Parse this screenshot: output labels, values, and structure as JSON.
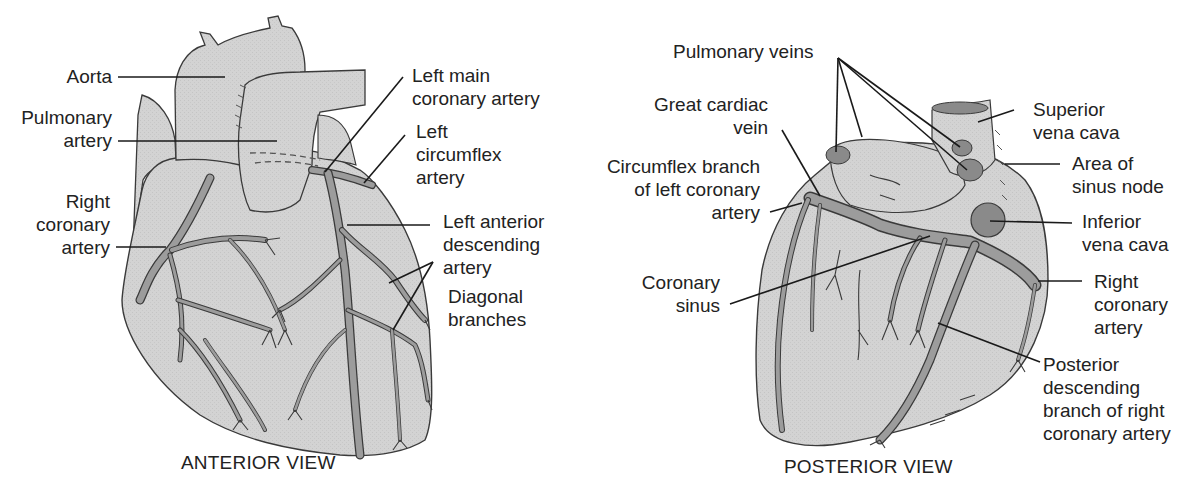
{
  "figure": {
    "views": [
      {
        "id": "anterior",
        "caption": "ANTERIOR VIEW"
      },
      {
        "id": "posterior",
        "caption": "POSTERIOR VIEW"
      }
    ],
    "colors": {
      "tissue": "#d2d2d2",
      "vessel": "#9a9a9a",
      "vein_opening": "#8a8a8a",
      "outline": "#3a3a3a",
      "leader": "#1a1a1a",
      "text": "#222222",
      "background": "#ffffff"
    }
  },
  "anterior": {
    "labels": {
      "aorta": [
        "Aorta"
      ],
      "pulmonary_artery": [
        "Pulmonary",
        "artery"
      ],
      "right_coronary_artery": [
        "Right",
        "coronary",
        "artery"
      ],
      "left_main_coronary_artery": [
        "Left main",
        "coronary artery"
      ],
      "left_circumflex_artery": [
        "Left",
        "circumflex",
        "artery"
      ],
      "left_anterior_descending_artery": [
        "Left anterior",
        "descending",
        "artery"
      ],
      "diagonal_branches": [
        "Diagonal",
        "branches"
      ]
    }
  },
  "posterior": {
    "labels": {
      "pulmonary_veins": [
        "Pulmonary veins"
      ],
      "great_cardiac_vein": [
        "Great cardiac",
        "vein"
      ],
      "circumflex_branch": [
        "Circumflex branch",
        "of left coronary",
        "artery"
      ],
      "coronary_sinus": [
        "Coronary",
        "sinus"
      ],
      "superior_vena_cava": [
        "Superior",
        "vena cava"
      ],
      "area_of_sinus_node": [
        "Area of",
        "sinus node"
      ],
      "inferior_vena_cava": [
        "Inferior",
        "vena cava"
      ],
      "right_coronary_artery": [
        "Right",
        "coronary",
        "artery"
      ],
      "posterior_descending_branch": [
        "Posterior",
        "descending",
        "branch of right",
        "coronary artery"
      ]
    }
  }
}
